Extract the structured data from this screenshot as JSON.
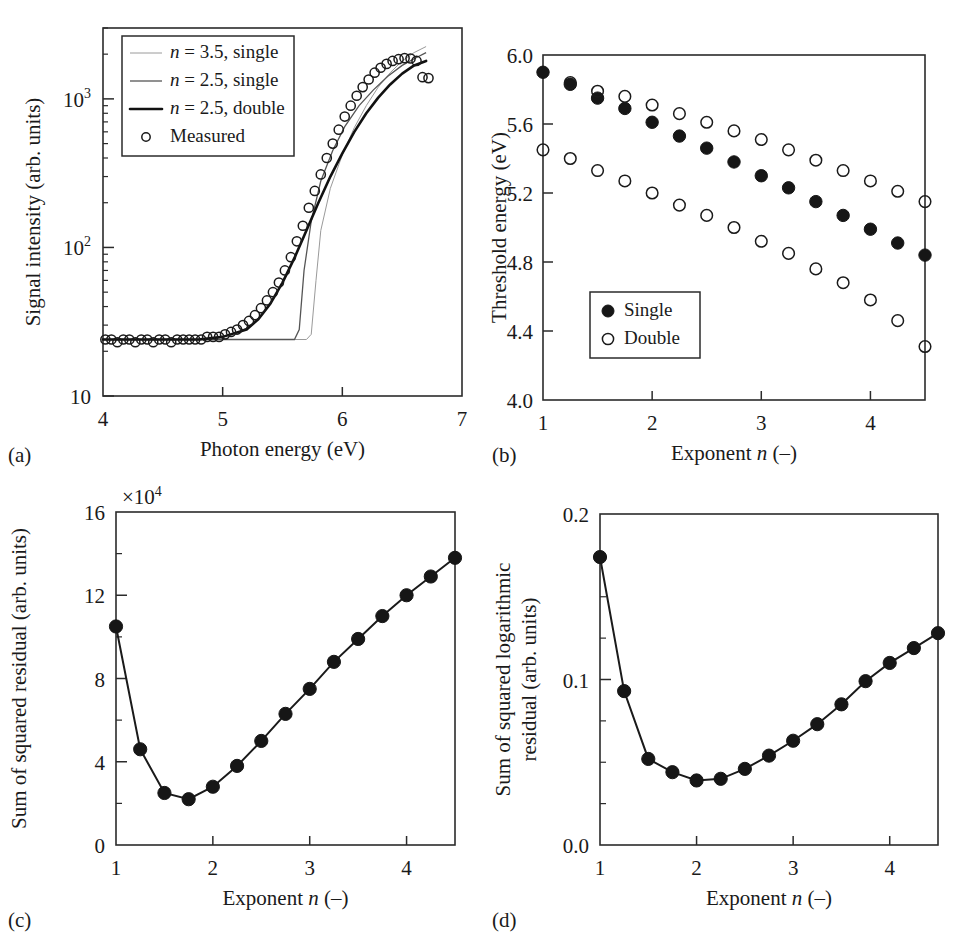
{
  "figure": {
    "panel_labels": [
      "(a)",
      "(b)",
      "(c)",
      "(d)"
    ]
  },
  "chart_data": [
    {
      "id": "a",
      "type": "line",
      "title": "",
      "xlabel": "Photon energy (eV)",
      "ylabel": "Signal intensity (arb. units)",
      "xlim": [
        4,
        7
      ],
      "ylim": [
        10,
        3000
      ],
      "yscale": "log",
      "xticks": [
        4,
        5,
        6,
        7
      ],
      "xticklabels": [
        "4",
        "5",
        "6",
        "7"
      ],
      "yticks": [
        10,
        100,
        1000
      ],
      "yticklabels": [
        "10",
        "10²",
        "10³"
      ],
      "grid": false,
      "legend_position": "upper-left",
      "legend": [
        {
          "label": "n = 3.5, single",
          "style": "faint-line"
        },
        {
          "label": "n = 2.5, single",
          "style": "thin-line"
        },
        {
          "label": "n = 2.5, double",
          "style": "thick-line"
        },
        {
          "label": "Measured",
          "style": "open-circle"
        }
      ],
      "series": [
        {
          "name": "n = 3.5, single",
          "style": "faint-line",
          "x": [
            4.0,
            5.0,
            5.5,
            5.7,
            5.74,
            5.78,
            5.82,
            5.9,
            6.0,
            6.1,
            6.2,
            6.3,
            6.4,
            6.5,
            6.6,
            6.7
          ],
          "y": [
            24,
            24,
            24,
            24,
            26,
            60,
            130,
            250,
            420,
            640,
            900,
            1200,
            1500,
            1800,
            2050,
            2250
          ]
        },
        {
          "name": "n = 2.5, single",
          "style": "thin-line",
          "x": [
            4.0,
            5.0,
            5.45,
            5.6,
            5.64,
            5.68,
            5.74,
            5.82,
            5.92,
            6.02,
            6.14,
            6.26,
            6.38,
            6.5,
            6.62,
            6.7
          ],
          "y": [
            24,
            24,
            24,
            24,
            28,
            70,
            150,
            280,
            450,
            650,
            900,
            1150,
            1420,
            1680,
            1900,
            2050
          ]
        },
        {
          "name": "n = 2.5, double",
          "style": "thick-line",
          "x": [
            4.0,
            4.4,
            4.8,
            5.0,
            5.2,
            5.3,
            5.4,
            5.5,
            5.6,
            5.7,
            5.8,
            5.9,
            6.0,
            6.1,
            6.2,
            6.3,
            6.4,
            6.5,
            6.6,
            6.7
          ],
          "y": [
            24,
            24,
            24,
            25,
            28,
            33,
            42,
            58,
            85,
            130,
            200,
            300,
            430,
            600,
            800,
            1020,
            1250,
            1480,
            1680,
            1800
          ]
        },
        {
          "name": "Measured",
          "style": "open-circle",
          "x": [
            4.02,
            4.07,
            4.12,
            4.17,
            4.22,
            4.27,
            4.32,
            4.37,
            4.42,
            4.47,
            4.52,
            4.57,
            4.62,
            4.67,
            4.72,
            4.77,
            4.82,
            4.87,
            4.92,
            4.97,
            5.02,
            5.07,
            5.12,
            5.17,
            5.22,
            5.27,
            5.32,
            5.37,
            5.42,
            5.47,
            5.52,
            5.57,
            5.62,
            5.67,
            5.72,
            5.77,
            5.82,
            5.87,
            5.92,
            5.97,
            6.02,
            6.07,
            6.12,
            6.17,
            6.22,
            6.27,
            6.32,
            6.37,
            6.42,
            6.47,
            6.52,
            6.57,
            6.62,
            6.67,
            6.72
          ],
          "y": [
            24,
            24,
            23,
            24,
            24,
            23,
            24,
            24,
            23,
            24,
            24,
            23,
            24,
            24,
            24,
            24,
            24,
            25,
            25,
            25,
            26,
            27,
            28,
            30,
            32,
            35,
            39,
            44,
            50,
            58,
            70,
            86,
            110,
            140,
            185,
            240,
            310,
            400,
            500,
            620,
            760,
            900,
            1050,
            1200,
            1350,
            1500,
            1620,
            1720,
            1800,
            1850,
            1880,
            1870,
            1800,
            1400,
            1380
          ]
        }
      ]
    },
    {
      "id": "b",
      "type": "scatter",
      "title": "",
      "xlabel": "Exponent n (–)",
      "ylabel": "Threshold energy (eV)",
      "xlim": [
        1,
        4.5
      ],
      "ylim": [
        4.0,
        6.0
      ],
      "xticks": [
        1,
        2,
        3,
        4
      ],
      "xticklabels": [
        "1",
        "2",
        "3",
        "4"
      ],
      "yticks": [
        4.0,
        4.4,
        4.8,
        5.2,
        5.6,
        6.0
      ],
      "yticklabels": [
        "4.0",
        "4.4",
        "4.8",
        "5.2",
        "5.6",
        "6.0"
      ],
      "grid": false,
      "legend_position": "lower-left",
      "legend": [
        {
          "label": "Single",
          "style": "filled-circle"
        },
        {
          "label": "Double",
          "style": "open-circle"
        }
      ],
      "series": [
        {
          "name": "Single",
          "style": "filled-circle",
          "x": [
            1.0,
            1.25,
            1.5,
            1.75,
            2.0,
            2.25,
            2.5,
            2.75,
            3.0,
            3.25,
            3.5,
            3.75,
            4.0,
            4.25,
            4.5
          ],
          "y": [
            5.9,
            5.83,
            5.75,
            5.69,
            5.61,
            5.53,
            5.46,
            5.38,
            5.3,
            5.23,
            5.15,
            5.07,
            4.99,
            4.91,
            4.84
          ]
        },
        {
          "name": "Double (upper)",
          "style": "open-circle",
          "x": [
            1.25,
            1.5,
            1.75,
            2.0,
            2.25,
            2.5,
            2.75,
            3.0,
            3.25,
            3.5,
            3.75,
            4.0,
            4.25,
            4.5
          ],
          "y": [
            5.84,
            5.79,
            5.76,
            5.71,
            5.66,
            5.61,
            5.56,
            5.51,
            5.45,
            5.39,
            5.33,
            5.27,
            5.21,
            5.15
          ]
        },
        {
          "name": "Double (lower)",
          "style": "open-circle",
          "x": [
            1.0,
            1.25,
            1.5,
            1.75,
            2.0,
            2.25,
            2.5,
            2.75,
            3.0,
            3.25,
            3.5,
            3.75,
            4.0,
            4.25,
            4.5
          ],
          "y": [
            5.45,
            5.4,
            5.33,
            5.27,
            5.2,
            5.13,
            5.07,
            5.0,
            4.92,
            4.85,
            4.76,
            4.68,
            4.58,
            4.46,
            4.31
          ]
        }
      ]
    },
    {
      "id": "c",
      "type": "line",
      "title": "",
      "xlabel": "Exponent n (–)",
      "ylabel": "Sum of squared residual (arb. units)",
      "y_offset_text": "×10⁴",
      "xlim": [
        1,
        4.5
      ],
      "ylim": [
        0,
        16
      ],
      "xticks": [
        1,
        2,
        3,
        4
      ],
      "xticklabels": [
        "1",
        "2",
        "3",
        "4"
      ],
      "yticks": [
        0,
        4,
        8,
        12,
        16
      ],
      "yticklabels": [
        "0",
        "4",
        "8",
        "12",
        "16"
      ],
      "yminor": [
        2,
        6,
        10,
        14
      ],
      "grid": false,
      "series": [
        {
          "name": "Sum of squared residual",
          "style": "filled-circle-line",
          "x": [
            1.0,
            1.25,
            1.5,
            1.75,
            2.0,
            2.25,
            2.5,
            2.75,
            3.0,
            3.25,
            3.5,
            3.75,
            4.0,
            4.25,
            4.5
          ],
          "y": [
            10.5,
            4.6,
            2.5,
            2.2,
            2.8,
            3.8,
            5.0,
            6.3,
            7.5,
            8.8,
            9.9,
            11.0,
            12.0,
            12.9,
            13.8
          ]
        }
      ]
    },
    {
      "id": "d",
      "type": "line",
      "title": "",
      "xlabel": "Exponent n (–)",
      "ylabel": "Sum of squared logarithmic residual (arb. units)",
      "ylabel_line1": "Sum of squared logarithmic",
      "ylabel_line2": "residual (arb. units)",
      "xlim": [
        1,
        4.5
      ],
      "ylim": [
        0.0,
        0.2
      ],
      "xticks": [
        1,
        2,
        3,
        4
      ],
      "xticklabels": [
        "1",
        "2",
        "3",
        "4"
      ],
      "yticks": [
        0.0,
        0.1,
        0.2
      ],
      "yticklabels": [
        "0.0",
        "0.1",
        "0.2"
      ],
      "yminor": [
        0.025,
        0.05,
        0.075,
        0.125,
        0.15,
        0.175
      ],
      "grid": false,
      "series": [
        {
          "name": "Sum of squared logarithmic residual",
          "style": "filled-circle-line",
          "x": [
            1.0,
            1.25,
            1.5,
            1.75,
            2.0,
            2.25,
            2.5,
            2.75,
            3.0,
            3.25,
            3.5,
            3.75,
            4.0,
            4.25,
            4.5
          ],
          "y": [
            0.174,
            0.093,
            0.052,
            0.044,
            0.039,
            0.04,
            0.046,
            0.054,
            0.063,
            0.073,
            0.085,
            0.099,
            0.11,
            0.119,
            0.128
          ]
        }
      ]
    }
  ]
}
